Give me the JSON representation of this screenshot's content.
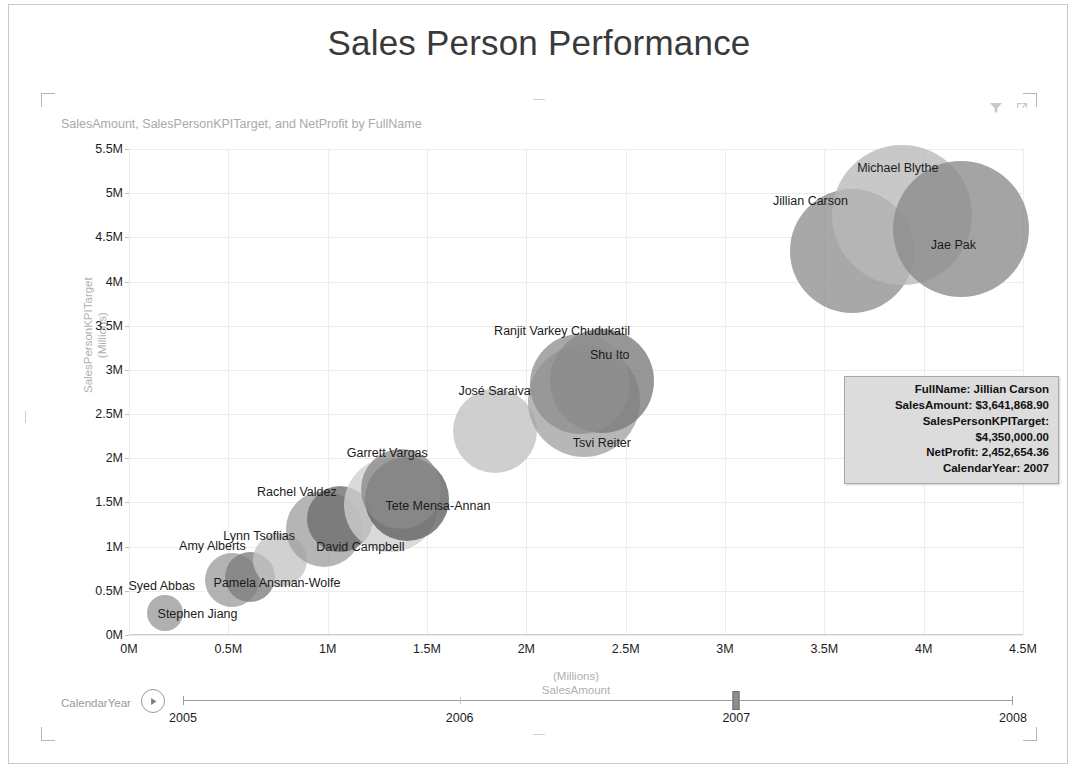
{
  "report": {
    "title": "Sales Person Performance"
  },
  "visual": {
    "header": "SalesAmount, SalesPersonKPITarget, and NetProfit by FullName",
    "icons": [
      {
        "name": "filter-icon",
        "label": "Filter"
      },
      {
        "name": "focus-mode-icon",
        "label": "Focus mode"
      }
    ]
  },
  "tooltip": {
    "lines": [
      "FullName: Jillian Carson",
      "SalesAmount: $3,641,868.90",
      "SalesPersonKPITarget: $4,350,000.00",
      "NetProfit: 2,452,654.36",
      "CalendarYear: 2007"
    ]
  },
  "timeline": {
    "label": "CalendarYear",
    "play_icon": "play-icon",
    "min": 2005,
    "max": 2008,
    "value": 2007,
    "ticks": [
      "2005",
      "2006",
      "2007",
      "2008"
    ]
  },
  "chart_data": {
    "type": "scatter",
    "title": "SalesAmount, SalesPersonKPITarget, and NetProfit by FullName",
    "xlabel": "SalesAmount",
    "xlabel_unit": "(Millions)",
    "ylabel": "SalesPersonKPITarget",
    "ylabel_unit": "(Millions)",
    "xlim": [
      0,
      4500000
    ],
    "ylim": [
      0,
      5500000
    ],
    "xticks": [
      "0M",
      "0.5M",
      "1M",
      "1.5M",
      "2M",
      "2.5M",
      "3M",
      "3.5M",
      "4M",
      "4.5M"
    ],
    "xtick_values": [
      0,
      500000,
      1000000,
      1500000,
      2000000,
      2500000,
      3000000,
      3500000,
      4000000,
      4500000
    ],
    "yticks": [
      "0M",
      "0.5M",
      "1M",
      "1.5M",
      "2M",
      "2.5M",
      "3M",
      "3.5M",
      "4M",
      "4.5M",
      "5M",
      "5.5M"
    ],
    "ytick_values": [
      0,
      500000,
      1000000,
      1500000,
      2000000,
      2500000,
      3000000,
      3500000,
      4000000,
      4500000,
      5000000,
      5500000
    ],
    "grid": true,
    "legend": "none",
    "size_measure": "NetProfit",
    "points": [
      {
        "name": "Stephen Jiang",
        "x": 180000,
        "y": 250000,
        "r": 18,
        "shade": "#9a9a9a",
        "lx": 345000,
        "ly": 240000
      },
      {
        "name": "Syed Abbas",
        "x": 520000,
        "y": 620000,
        "r": 27,
        "shade": "#9e9e9e",
        "lx": 165000,
        "ly": 560000
      },
      {
        "name": "Amy Alberts",
        "x": 610000,
        "y": 660000,
        "r": 25,
        "shade": "#7d7d7d",
        "lx": 420000,
        "ly": 1010000
      },
      {
        "name": "Pamela Ansman-Wolfe",
        "x": 760000,
        "y": 850000,
        "r": 27,
        "shade": "#c4c4c4",
        "lx": 745000,
        "ly": 590000
      },
      {
        "name": "Lynn Tsoflias",
        "x": 980000,
        "y": 1200000,
        "r": 38,
        "shade": "#a0a0a0",
        "lx": 655000,
        "ly": 1115000
      },
      {
        "name": "Rachel Valdez",
        "x": 1060000,
        "y": 1310000,
        "r": 33,
        "shade": "#6b6b6b",
        "lx": 845000,
        "ly": 1620000
      },
      {
        "name": "David Campbell",
        "x": 1320000,
        "y": 1470000,
        "r": 47,
        "shade": "#cfcfcf",
        "lx": 1165000,
        "ly": 1000000
      },
      {
        "name": "Tete Mensa-Annan",
        "x": 1400000,
        "y": 1540000,
        "r": 42,
        "shade": "#5f5f5f",
        "lx": 1555000,
        "ly": 1460000
      },
      {
        "name": "Garrett Vargas",
        "x": 1370000,
        "y": 1650000,
        "r": 40,
        "shade": "#8a8a8a",
        "lx": 1300000,
        "ly": 2060000
      },
      {
        "name": "José Saraiva",
        "x": 1840000,
        "y": 2310000,
        "r": 42,
        "shade": "#c2c2c2",
        "lx": 1840000,
        "ly": 2760000
      },
      {
        "name": "Tsvi Reiter",
        "x": 2290000,
        "y": 2650000,
        "r": 56,
        "shade": "#a3a3a3",
        "lx": 2380000,
        "ly": 2170000
      },
      {
        "name": "Shu Ito",
        "x": 2380000,
        "y": 2870000,
        "r": 52,
        "shade": "#7a7a7a",
        "lx": 2420000,
        "ly": 3170000
      },
      {
        "name": "Ranjit Varkey Chudukatil",
        "x": 2270000,
        "y": 2840000,
        "r": 50,
        "shade": "#8f8f8f",
        "lx": 2180000,
        "ly": 3440000
      },
      {
        "name": "Jillian Carson",
        "x": 3640000,
        "y": 4350000,
        "r": 62,
        "shade": "#8f8f8f",
        "lx": 3430000,
        "ly": 4910000
      },
      {
        "name": "Michael Blythe",
        "x": 3890000,
        "y": 4750000,
        "r": 70,
        "shade": "#b8b8b8",
        "lx": 3870000,
        "ly": 5290000
      },
      {
        "name": "Jae Pak",
        "x": 4190000,
        "y": 4600000,
        "r": 68,
        "shade": "#8b8b8b",
        "lx": 4150000,
        "ly": 4410000
      }
    ]
  }
}
